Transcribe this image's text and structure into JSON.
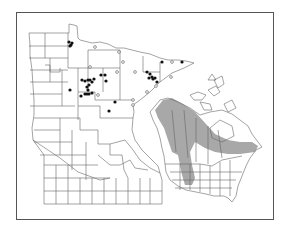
{
  "figure": {
    "type": "species distribution map",
    "panels": [
      {
        "name": "Minnesota county map",
        "legend": {
          "filled_circle": "recorded occurrence (specimen)",
          "open_circle": "other/historical record"
        },
        "filled_points": [
          [
            69,
            42
          ],
          [
            71,
            45
          ],
          [
            72,
            43
          ],
          [
            70,
            46
          ],
          [
            82,
            80
          ],
          [
            85,
            81
          ],
          [
            88,
            80
          ],
          [
            90,
            80
          ],
          [
            94,
            79
          ],
          [
            92,
            82
          ],
          [
            89,
            85
          ],
          [
            87,
            87
          ],
          [
            88,
            90
          ],
          [
            87,
            94
          ],
          [
            81,
            96
          ],
          [
            85,
            94
          ],
          [
            89,
            94
          ],
          [
            92,
            93
          ],
          [
            70,
            90
          ],
          [
            101,
            75
          ],
          [
            105,
            75
          ],
          [
            106,
            81
          ],
          [
            115,
            102
          ],
          [
            109,
            111
          ],
          [
            162,
            62
          ],
          [
            182,
            62
          ],
          [
            147,
            72
          ],
          [
            150,
            74
          ],
          [
            152,
            77
          ],
          [
            149,
            78
          ],
          [
            153,
            79
          ],
          [
            155,
            78
          ],
          [
            157,
            82
          ]
        ],
        "open_points": [
          [
            95,
            47
          ],
          [
            119,
            52
          ],
          [
            123,
            62
          ],
          [
            172,
            62
          ],
          [
            90,
            67
          ],
          [
            117,
            72
          ],
          [
            135,
            72
          ],
          [
            98,
            95
          ],
          [
            147,
            92
          ],
          [
            156,
            86
          ],
          [
            133,
            100
          ],
          [
            133,
            105
          ],
          [
            171,
            77
          ]
        ],
        "colors": {
          "filled": "#111111",
          "open": "#ffffff",
          "boundary": "#666666"
        }
      },
      {
        "name": "North America range map",
        "range_fill": "#9a9a9a",
        "description": "Shaded range band from Alaska/Yukon through western Canada, across boreal Canada to Quebec/Maritimes, with extension south along the Rocky Mountains"
      }
    ]
  }
}
